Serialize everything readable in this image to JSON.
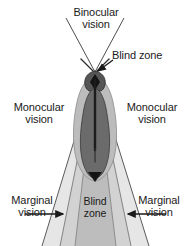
{
  "figure": {
    "labels": {
      "binocular_line1": "Binocular",
      "binocular_line2": "vision",
      "blind_zone_top": "Blind zone",
      "monocular_left_line1": "Monocular",
      "monocular_left_line2": "vision",
      "monocular_right_line1": "Monocular",
      "monocular_right_line2": "vision",
      "marginal_left_line1": "Marginal",
      "marginal_left_line2": "vision",
      "marginal_right_line1": "Marginal",
      "marginal_right_line2": "vision",
      "blind_zone_bottom_line1": "Blind",
      "blind_zone_bottom_line2": "zone"
    },
    "colors": {
      "background": "#ffffff",
      "text": "#1a1a1a",
      "stroke": "#3a3a3a",
      "marginal_fill": "#e3e3e3",
      "monocular_fill": "#cfcfcf",
      "blind_zone_fill": "#b2b2b2",
      "body_fill": "#6e6e6e",
      "body_dark": "#2b2b2b",
      "head_fill": "#4a4a4a"
    },
    "zones": [
      {
        "name": "binocular-vision",
        "label": "Binocular vision",
        "position": "top-center"
      },
      {
        "name": "blind-zone-head",
        "label": "Blind zone",
        "position": "head"
      },
      {
        "name": "monocular-vision-left",
        "label": "Monocular vision",
        "position": "left"
      },
      {
        "name": "monocular-vision-right",
        "label": "Monocular vision",
        "position": "right"
      },
      {
        "name": "marginal-vision-left",
        "label": "Marginal vision",
        "position": "bottom-left"
      },
      {
        "name": "marginal-vision-right",
        "label": "Marginal vision",
        "position": "bottom-right"
      },
      {
        "name": "blind-zone-rear",
        "label": "Blind zone",
        "position": "bottom-center"
      }
    ]
  }
}
